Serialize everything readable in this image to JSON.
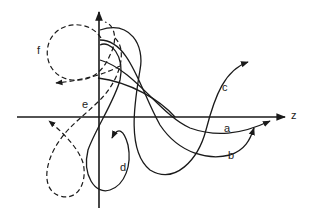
{
  "diagram": {
    "type": "trajectory-sketch",
    "axes": {
      "horizontal_label": "z",
      "vertical_label": ""
    },
    "curves": [
      {
        "id": "a",
        "label": "a",
        "style": "solid"
      },
      {
        "id": "b",
        "label": "b",
        "style": "solid"
      },
      {
        "id": "c",
        "label": "c",
        "style": "solid"
      },
      {
        "id": "d",
        "label": "d",
        "style": "solid"
      },
      {
        "id": "e",
        "label": "e",
        "style": "dashed"
      },
      {
        "id": "f",
        "label": "f",
        "style": "dashed"
      }
    ],
    "colors": {
      "stroke": "#1a1a1a",
      "background": "#ffffff"
    }
  }
}
